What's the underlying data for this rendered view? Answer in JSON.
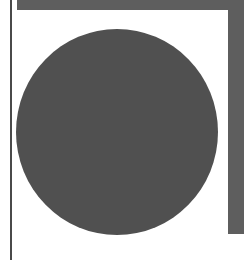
{
  "colors": {
    "background": "#ffffff",
    "bar": "#5e5e5e",
    "line": "#4a4a4a",
    "circle": "#505050"
  },
  "shapes": {
    "circle": {
      "fill": "#505050"
    }
  }
}
